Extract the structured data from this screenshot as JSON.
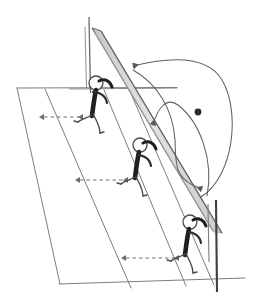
{
  "figure": {
    "style": "hand-drawn pencil sketch, monochrome",
    "background_color": "#ffffff",
    "line_color": "#6b6b6b",
    "dark_line_color": "#3a3a3a",
    "net_fill_color": "#d8d8d8",
    "ball_color": "#2b2b2b",
    "dashed_color": "#7a7a7a"
  },
  "court": {
    "name": "court-outline",
    "top_baseline": {
      "x1": 17,
      "y1": 88,
      "x2": 177,
      "y2": 88
    },
    "bottom_baseline": {
      "x1": 60,
      "y1": 283,
      "x2": 243,
      "y2": 278
    },
    "left_sideline": {
      "x1": 17,
      "y1": 88,
      "x2": 60,
      "y2": 283
    },
    "mid_line": {
      "x1": 45,
      "y1": 90,
      "x2": 130,
      "y2": 286
    },
    "right_line": {
      "x1": 103,
      "y1": 91,
      "x2": 185,
      "y2": 285
    },
    "far_line": {
      "x1": 128,
      "y1": 90,
      "x2": 213,
      "y2": 284
    }
  },
  "net": {
    "name": "net-band",
    "top_x": 92,
    "top_y": 30,
    "bottom_x": 213,
    "bottom_y": 230,
    "band_width": 13,
    "fill": "#d8d8d8",
    "edge": "#6b6b6b"
  },
  "posts": [
    {
      "label": "left-net-post",
      "x": 89,
      "y_top": 17,
      "y_bottom": 92,
      "width": 1.4
    },
    {
      "label": "right-net-post",
      "x": 216,
      "y_top": 200,
      "y_bottom": 292,
      "width": 2.2
    }
  ],
  "players": [
    {
      "id": "player-1",
      "label": "blocker-front",
      "head_cx": 96,
      "head_cy": 83,
      "head_r": 7,
      "position_note": "at left net post, arms raised to net"
    },
    {
      "id": "player-2",
      "label": "blocker-middle",
      "head_cx": 140,
      "head_cy": 145,
      "head_r": 7,
      "position_note": "mid net, arms raised to net"
    },
    {
      "id": "player-3",
      "label": "blocker-back",
      "head_cx": 190,
      "head_cy": 222,
      "head_r": 7,
      "position_note": "at right net post, arms raised to net"
    }
  ],
  "trajectories": [
    {
      "id": "arc-1",
      "label": "ball-path-outer",
      "note": "long outer arc sweeping from lower right up over the net to an arrowhead pointing left at the top",
      "arrow_at": {
        "x": 129,
        "y": 67,
        "direction": "left"
      }
    },
    {
      "id": "arc-2",
      "label": "ball-path-middle",
      "note": "arc descending to an arrowhead pointing down-left just above the middle blocker",
      "arrow_at": {
        "x": 152,
        "y": 129,
        "direction": "down-left"
      }
    },
    {
      "id": "arc-3",
      "label": "ball-path-inner",
      "note": "arc descending to an arrowhead pointing down near the back blocker",
      "arrow_at": {
        "x": 201,
        "y": 193,
        "direction": "down"
      }
    }
  ],
  "ball": {
    "name": "ball-marker",
    "cx": 198,
    "cy": 112,
    "r": 3.4,
    "color": "#2b2b2b"
  },
  "distance_arrows": [
    {
      "id": "distance-1",
      "label": "sideline-to-front-blocker",
      "x1": 43,
      "y1": 117,
      "x2": 84,
      "y2": 117
    },
    {
      "id": "distance-2",
      "label": "sideline-to-middle-blocker",
      "x1": 79,
      "y1": 180,
      "x2": 129,
      "y2": 180
    },
    {
      "id": "distance-3",
      "label": "sideline-to-back-blocker",
      "x1": 125,
      "y1": 258,
      "x2": 180,
      "y2": 258
    }
  ],
  "net_tape": {
    "name": "net-tape-line",
    "x1": 69,
    "y1": 89,
    "x2": 177,
    "y2": 88
  }
}
